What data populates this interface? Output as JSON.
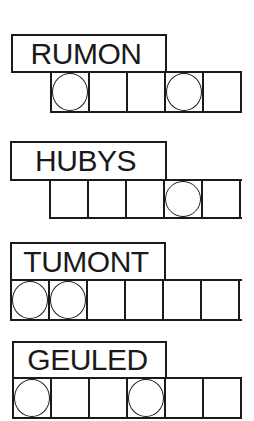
{
  "puzzles": [
    {
      "scrambled_word": "RUMON",
      "letter_count": 5,
      "circled_positions": [
        1,
        4
      ]
    },
    {
      "scrambled_word": "HUBYS",
      "letter_count": 5,
      "circled_positions": [
        4
      ]
    },
    {
      "scrambled_word": "TUMONT",
      "letter_count": 6,
      "circled_positions": [
        1,
        2
      ]
    },
    {
      "scrambled_word": "GEULED",
      "letter_count": 6,
      "circled_positions": [
        1,
        4
      ]
    }
  ],
  "colors": {
    "ink": "#1a1a1a",
    "paper": "#ffffff"
  }
}
